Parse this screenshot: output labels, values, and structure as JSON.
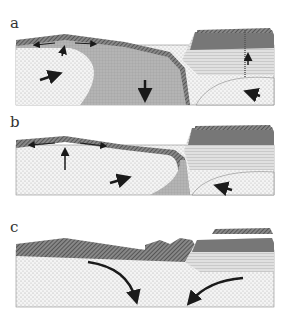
{
  "panels": [
    {
      "label": "a"
    },
    {
      "label": "b"
    },
    {
      "label": "c"
    }
  ],
  "colors": {
    "mantle": "#f2f2f2",
    "slab": "#b8b8b8",
    "crust_hatch": "#5a5a5a",
    "continent_dark": "#7a7a7a",
    "continent_light": "#e6e6e6",
    "arrow": "#1a1a1a"
  }
}
